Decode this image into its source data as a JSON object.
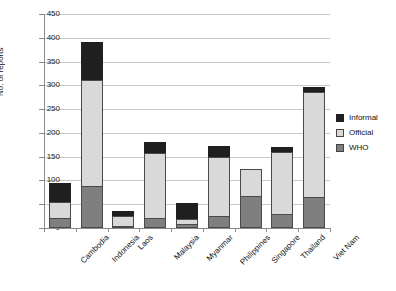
{
  "chart_data": {
    "type": "bar",
    "stacked": true,
    "title": "",
    "xlabel": "",
    "ylabel": "No. of reports",
    "ylim": [
      0,
      450
    ],
    "ytick_step": 50,
    "yticks": [
      0,
      50,
      100,
      150,
      200,
      250,
      300,
      350,
      400,
      450
    ],
    "grid": true,
    "legend_position": "right",
    "categories": [
      "Cambodia",
      "Indonesia",
      "Laos",
      "Malaysia",
      "Myanmar",
      "Philippines",
      "Singapore",
      "Thailand",
      "Viet Nam"
    ],
    "series": [
      {
        "name": "WHO",
        "color": "#7f7f7f",
        "values": [
          22,
          88,
          5,
          22,
          8,
          25,
          68,
          30,
          65
        ]
      },
      {
        "name": "Official",
        "color": "#d9d9d9",
        "values": [
          33,
          224,
          20,
          135,
          12,
          125,
          57,
          130,
          222
        ]
      },
      {
        "name": "Informal",
        "color": "#1f1f1f",
        "values": [
          40,
          80,
          10,
          23,
          32,
          22,
          0,
          10,
          10
        ]
      }
    ],
    "totals": [
      95,
      392,
      35,
      180,
      52,
      172,
      125,
      170,
      297
    ]
  },
  "legend": {
    "items": [
      {
        "label": "Informal",
        "swatch": "informal"
      },
      {
        "label": "Official",
        "swatch": "official"
      },
      {
        "label": "WHO",
        "swatch": "who"
      }
    ]
  },
  "axis": {
    "y_title": "No. of reports"
  }
}
